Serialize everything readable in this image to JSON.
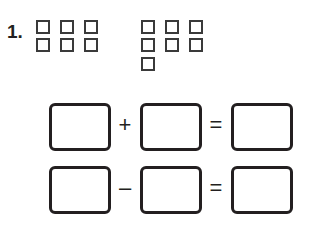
{
  "problem": {
    "number_label": "1.",
    "group_left": {
      "columns": 3,
      "rows": 2,
      "count": 6
    },
    "group_right": {
      "columns": 3,
      "rows": 3,
      "count": 7
    },
    "equations": [
      {
        "operator": "+",
        "equals": "="
      },
      {
        "operator": "–",
        "equals": "="
      }
    ]
  }
}
